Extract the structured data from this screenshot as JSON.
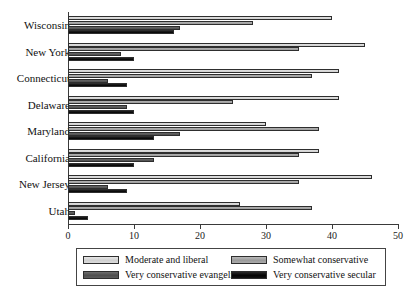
{
  "chart_data": {
    "type": "bar",
    "orientation": "horizontal",
    "title": "",
    "subtitle": "",
    "xlabel": "",
    "ylabel": "",
    "xlim": [
      0,
      50
    ],
    "ylim": null,
    "grid": false,
    "legend_position": "bottom",
    "axis_ticks": [
      0,
      10,
      20,
      30,
      40,
      50
    ],
    "categories": [
      "Wisconsin",
      "New York",
      "Connecticut",
      "Delaware",
      "Maryland",
      "California",
      "New Jersey",
      "Utah"
    ],
    "series": [
      {
        "name": "Moderate and liberal",
        "color": "#d8d8d8",
        "values": [
          40,
          45,
          41,
          41,
          30,
          38,
          46,
          26
        ]
      },
      {
        "name": "Somewhat conservative",
        "color": "#a5a5a5",
        "values": [
          28,
          35,
          37,
          25,
          38,
          35,
          35,
          37
        ]
      },
      {
        "name": "Very conservative evangelical",
        "color": "#575757",
        "values": [
          17,
          8,
          6,
          9,
          17,
          13,
          6,
          1
        ]
      },
      {
        "name": "Very conservative secular",
        "color": "#0d0d0d",
        "values": [
          16,
          10,
          9,
          10,
          13,
          10,
          9,
          3
        ]
      }
    ]
  },
  "legend": {
    "entries": [
      "Moderate and liberal",
      "Somewhat conservative",
      "Very conservative evangelical",
      "Very conservative secular"
    ]
  }
}
